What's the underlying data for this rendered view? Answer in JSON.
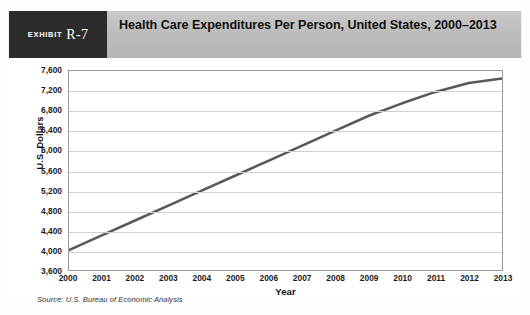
{
  "exhibit": {
    "word": "Exhibit",
    "number": "R-7"
  },
  "header": {
    "title": "Health Care Expenditures Per Person, United States, 2000–2013"
  },
  "source": {
    "text": "Source: U.S. Bureau of Economic Analysis"
  },
  "colors": {
    "band": "#bdbdbd",
    "exhibit_box": "#2b2b2b",
    "line": "#595959",
    "grid": "#cfcfcf",
    "plot_border": "#9a9a9a"
  },
  "chart_data": {
    "type": "line",
    "title": "Health Care Expenditures Per Person, United States, 2000–2013",
    "xlabel": "Year",
    "ylabel": "U.S. Dollars",
    "categories": [
      "2000",
      "2001",
      "2002",
      "2003",
      "2004",
      "2005",
      "2006",
      "2007",
      "2008",
      "2009",
      "2010",
      "2011",
      "2012",
      "2013"
    ],
    "x": [
      2000,
      2001,
      2002,
      2003,
      2004,
      2005,
      2006,
      2007,
      2008,
      2009,
      2010,
      2011,
      2012,
      2013
    ],
    "values": [
      4000,
      4300,
      4600,
      4900,
      5200,
      5500,
      5800,
      6100,
      6400,
      6700,
      6950,
      7180,
      7360,
      7450
    ],
    "ylim": [
      3600,
      7600
    ],
    "ytick_step": 400,
    "yticks": [
      "3,600",
      "4,000",
      "4,400",
      "4,800",
      "5,200",
      "5,600",
      "6,000",
      "6,400",
      "6,800",
      "7,200",
      "7,600"
    ],
    "xlim": [
      2000,
      2013
    ],
    "grid": "horizontal",
    "legend": "none",
    "series": [
      {
        "name": "Health care expenditures per person (U.S. dollars)",
        "values": [
          4000,
          4300,
          4600,
          4900,
          5200,
          5500,
          5800,
          6100,
          6400,
          6700,
          6950,
          7180,
          7360,
          7450
        ]
      }
    ]
  }
}
